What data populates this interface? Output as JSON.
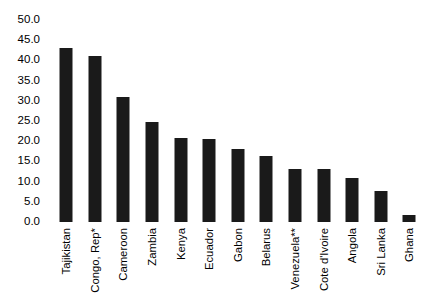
{
  "chart_data": {
    "type": "bar",
    "title": "",
    "subtitle": "",
    "xlabel": "",
    "ylabel": "",
    "ylim": [
      0,
      50
    ],
    "ytick_step": 5,
    "ytick_labels": [
      "50.0",
      "45.0",
      "40.0",
      "35.0",
      "30.0",
      "25.0",
      "20.0",
      "15.0",
      "10.0",
      "5.0",
      "0.0"
    ],
    "ytick_values": [
      50,
      45,
      40,
      35,
      30,
      25,
      20,
      15,
      10,
      5,
      0
    ],
    "grid": false,
    "legend": null,
    "bar_color": "#1a1a1a",
    "background_color": "#ffffff",
    "categories": [
      "Tajikistan",
      "Congo, Rep*",
      "Cameroon",
      "Zambia",
      "Kenya",
      "Ecuador",
      "Gabon",
      "Belarus",
      "Venezuela**",
      "Cote d'Ivoire",
      "Angola",
      "Sri Lanka",
      "Ghana"
    ],
    "values": [
      43.0,
      41.0,
      31.0,
      24.8,
      20.7,
      20.6,
      18.1,
      16.4,
      13.2,
      13.0,
      11.0,
      7.6,
      1.8
    ]
  }
}
